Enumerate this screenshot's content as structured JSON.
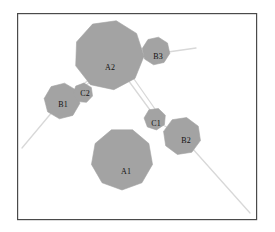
{
  "figure": {
    "title": "",
    "background_color": "#ffffff",
    "frame": {
      "x": 17,
      "y": 13,
      "width": 239,
      "height": 206,
      "stroke_color": "#4a4a4a",
      "stroke_width": 1.2,
      "fill_color": "#ffffff"
    },
    "style": {
      "node_fill_color": "#a3a3a3",
      "node_stroke_color": "#a3a3a3",
      "edge_color": "#d8d8d8",
      "edge_width": 1.3,
      "label_color": "#111111",
      "label_font_size": 8
    }
  },
  "chart_data": {
    "type": "diagram",
    "node_count": 7,
    "edge_count": 8,
    "nodes": [
      {
        "id": "A2",
        "label": "A2",
        "cx": 109,
        "cy": 55,
        "radius": 35,
        "sides": 9,
        "rotation": 12,
        "label_x": 110,
        "label_y": 68,
        "size_rank": 1
      },
      {
        "id": "A1",
        "label": "A1",
        "cx": 122,
        "cy": 159,
        "radius": 31,
        "sides": 9,
        "rotation": 20,
        "label_x": 126,
        "label_y": 172,
        "size_rank": 2
      },
      {
        "id": "B1",
        "label": "B1",
        "cx": 62,
        "cy": 101,
        "radius": 18,
        "sides": 8,
        "rotation": 8,
        "label_x": 63,
        "label_y": 105,
        "size_rank": 3
      },
      {
        "id": "B2",
        "label": "B2",
        "cx": 182,
        "cy": 136,
        "radius": 19,
        "sides": 8,
        "rotation": 14,
        "label_x": 186,
        "label_y": 141,
        "size_rank": 4
      },
      {
        "id": "B3",
        "label": "B3",
        "cx": 156,
        "cy": 51,
        "radius": 14,
        "sides": 8,
        "rotation": 10,
        "label_x": 158,
        "label_y": 57,
        "size_rank": 5
      },
      {
        "id": "C1",
        "label": "C1",
        "cx": 155,
        "cy": 119,
        "radius": 11,
        "sides": 7,
        "rotation": 18,
        "label_x": 156,
        "label_y": 124,
        "size_rank": 6
      },
      {
        "id": "C2",
        "label": "C2",
        "cx": 83,
        "cy": 93,
        "radius": 10,
        "sides": 7,
        "rotation": 5,
        "label_x": 85,
        "label_y": 94,
        "size_rank": 7
      }
    ],
    "edges": [
      {
        "id": "edge-a2-b1",
        "from": "A2",
        "to": "B1",
        "x1": 90,
        "y1": 79,
        "x2": 73,
        "y2": 92
      },
      {
        "id": "edge-a2-c2",
        "from": "A2",
        "to": "C2",
        "x1": 92,
        "y1": 81,
        "x2": 80,
        "y2": 89
      },
      {
        "id": "edge-a2-c1-left",
        "from": "A2",
        "to": "C1",
        "x1": 128,
        "y1": 80,
        "x2": 150,
        "y2": 110
      },
      {
        "id": "edge-a2-c1-right",
        "from": "A2",
        "to": "C1",
        "x1": 134,
        "y1": 79,
        "x2": 155,
        "y2": 109
      },
      {
        "id": "edge-b3-right-stub",
        "from": "B3",
        "to": "open-right",
        "x1": 168,
        "y1": 52,
        "x2": 196,
        "y2": 48
      },
      {
        "id": "edge-b1-lower-left-stub",
        "from": "B1",
        "to": "open-lower-left",
        "x1": 53,
        "y1": 111,
        "x2": 22,
        "y2": 148
      },
      {
        "id": "edge-c1-b2",
        "from": "C1",
        "to": "B2",
        "x1": 163,
        "y1": 125,
        "x2": 170,
        "y2": 129
      },
      {
        "id": "edge-b2-lower-right-stub",
        "from": "B2",
        "to": "open-lower-right",
        "x1": 192,
        "y1": 148,
        "x2": 250,
        "y2": 213
      }
    ],
    "legend": [],
    "axes": null,
    "grid": false
  }
}
